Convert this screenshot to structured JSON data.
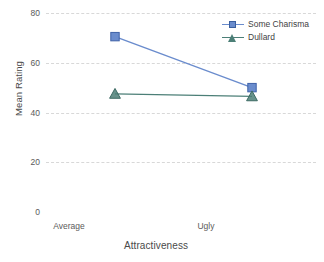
{
  "chart_data": {
    "type": "line",
    "title": "",
    "xlabel": "Attractiveness",
    "ylabel": "Mean Rating",
    "categories": [
      "Average",
      "Ugly"
    ],
    "yticks": [
      80,
      60,
      40,
      20,
      0
    ],
    "ylim": [
      0,
      80
    ],
    "grid": true,
    "legend_position": "top-right",
    "series": [
      {
        "name": "Some Charisma",
        "values": [
          70.5,
          50.0
        ],
        "color": "#6a8ccd",
        "marker": "square"
      },
      {
        "name": "Dullard",
        "values": [
          47.5,
          46.5
        ],
        "color": "#4c7f77",
        "marker": "triangle"
      }
    ]
  },
  "axes": {
    "y_title": "Mean Rating",
    "x_title": "Attractiveness",
    "y_tick_labels": [
      "80",
      "60",
      "40",
      "20",
      "0"
    ],
    "x_tick_labels": [
      "Average",
      "Ugly"
    ]
  },
  "legend": {
    "entries": [
      {
        "label": "Some Charisma",
        "marker": "square-marker-icon"
      },
      {
        "label": "Dullard",
        "marker": "triangle-marker-icon"
      }
    ]
  }
}
